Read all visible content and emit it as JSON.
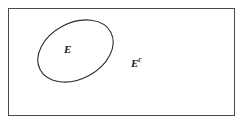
{
  "diagram": {
    "kind": "venn-complement-diagram",
    "background_color": "#ffffff",
    "universal_set": {
      "shape": "rectangle",
      "label": "",
      "stroke_color": "#4a4a4a",
      "stroke_width": 1,
      "fill": "none",
      "x": 8,
      "y": 8,
      "width": 227,
      "height": 108
    },
    "subset": {
      "shape": "ellipse",
      "label": "E",
      "stroke_color": "#2b2b2b",
      "stroke_width": 1,
      "fill": "none",
      "center_x": 75.5,
      "center_y": 51,
      "radius_x": 40,
      "radius_y": 28,
      "rotation_degrees": -28
    },
    "labels": [
      {
        "name": "set-label",
        "base": "E",
        "superscript": "",
        "x": 70,
        "y": 50
      },
      {
        "name": "complement-label",
        "base": "E",
        "superscript": "c",
        "x": 140,
        "y": 62
      }
    ]
  }
}
